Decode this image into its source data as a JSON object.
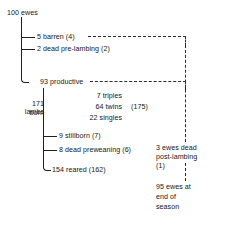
{
  "diagram": {
    "title_node": "100 ewes",
    "branches": [
      {
        "id": "barren",
        "label": "5 barren (4)"
      },
      {
        "id": "dead-pre-lambing",
        "label": "2 dead pre-lambing (2)"
      },
      {
        "id": "productive",
        "label": "93 productive"
      }
    ],
    "lambs": {
      "born_line1": "171 lambs",
      "born_line2": "born",
      "litters": [
        {
          "id": "triples",
          "label": "7 triples"
        },
        {
          "id": "twins",
          "label": "64 twins"
        },
        {
          "id": "singles",
          "label": "22 singles"
        }
      ],
      "litter_total": "(175)"
    },
    "lamb_outcomes": [
      {
        "id": "stillborn",
        "label": "9 stillborn (7)"
      },
      {
        "id": "dead-preweaning",
        "label": "8 dead preweaning (6)"
      },
      {
        "id": "reared",
        "label": "154 reared (162)"
      }
    ],
    "ewe_outcome": {
      "line1": "3 ewes dead",
      "line2": "post-lambing",
      "line3": "(1)"
    },
    "season_end": {
      "line1": "95 ewes at",
      "line2": "end of",
      "line3": "season"
    }
  },
  "style": {
    "line_color": "#1f1f1f",
    "dash_color": "#2a2a2a",
    "text_color": "#161616",
    "background": "#ffffff"
  }
}
